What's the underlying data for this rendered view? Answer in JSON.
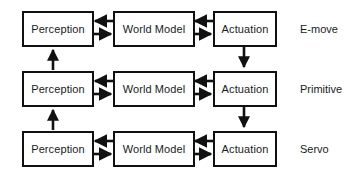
{
  "diagram": {
    "background_color": "#ffffff",
    "stroke_color": "#111111",
    "text_color": "#1b1b1b",
    "rows": [
      {
        "level_label": "E-move",
        "nodes": [
          {
            "label": "Perception"
          },
          {
            "label": "World Model"
          },
          {
            "label": "Actuation"
          }
        ]
      },
      {
        "level_label": "Primitive",
        "nodes": [
          {
            "label": "Perception"
          },
          {
            "label": "World Model"
          },
          {
            "label": "Actuation"
          }
        ]
      },
      {
        "level_label": "Servo",
        "nodes": [
          {
            "label": "Perception"
          },
          {
            "label": "World Model"
          },
          {
            "label": "Actuation"
          }
        ]
      }
    ],
    "connectors": {
      "horizontal_upper_direction": "left",
      "horizontal_lower_direction": "right",
      "vertical_left_direction": "up",
      "vertical_right_direction": "down"
    }
  }
}
